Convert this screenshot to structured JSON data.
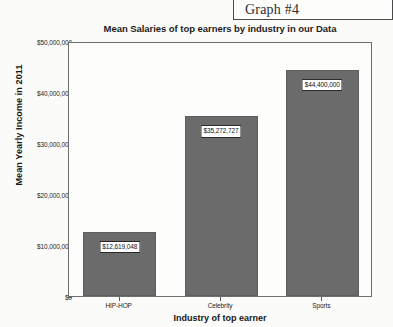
{
  "graph_tag": {
    "label": "Graph #4"
  },
  "chart_data": {
    "type": "bar",
    "title": "Mean Salaries of top earners by industry in our Data",
    "xlabel": "Industry of top earner",
    "ylabel": "Mean Yearly Income in 2011",
    "categories": [
      "HIP-HOP",
      "Celebrity",
      "Sports"
    ],
    "values": [
      12619048,
      35272727,
      44400000
    ],
    "value_labels": [
      "$12,619,048",
      "$35,272,727",
      "$44,400,000"
    ],
    "ylim": [
      0,
      50000000
    ],
    "ytick_values": [
      0,
      10000000,
      20000000,
      30000000,
      40000000,
      50000000
    ],
    "ytick_labels": [
      "$0",
      "$10,000,000",
      "$20,000,000",
      "$30,000,000",
      "$40,000,000",
      "$50,000,000"
    ],
    "grid": false,
    "legend": false,
    "bar_color": "#6b6b6b",
    "plot_background": "#fdfdfc"
  }
}
